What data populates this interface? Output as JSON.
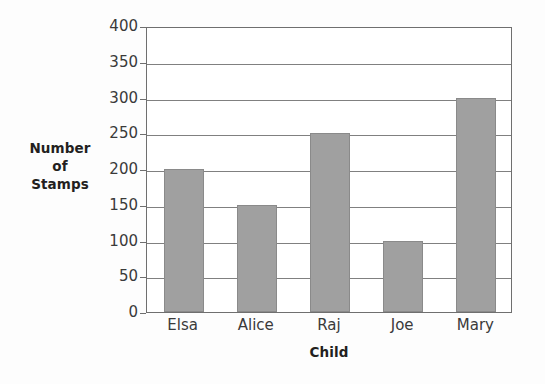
{
  "chart_data": {
    "type": "bar",
    "title": "",
    "xlabel": "Child",
    "ylabel": "Number of Stamps",
    "ylabel_lines": [
      "Number",
      "of",
      "Stamps"
    ],
    "categories": [
      "Elsa",
      "Alice",
      "Raj",
      "Joe",
      "Mary"
    ],
    "values": [
      200,
      150,
      250,
      100,
      300
    ],
    "ylim": [
      0,
      400
    ],
    "ytick_step": 50,
    "yticks": [
      0,
      50,
      100,
      150,
      200,
      250,
      300,
      350,
      400
    ],
    "ytick_labels": [
      "0",
      "50",
      "100",
      "150",
      "200",
      "250",
      "300",
      "350",
      "400"
    ],
    "grid": true,
    "grid_orientation": "horizontal",
    "legend": false,
    "legend_position": "none",
    "series": [
      {
        "name": "Number of Stamps",
        "values": [
          200,
          150,
          250,
          100,
          300
        ]
      }
    ],
    "colors": {
      "bar_fill": "#a0a0a0",
      "bar_stroke": "#8a8a8a",
      "gridline": "#808080",
      "axis": "#6f6f6f",
      "text": "#3a3a3a",
      "title_text": "#231f20",
      "background": "#fdfdfd",
      "plot_background": "#ffffff"
    }
  }
}
